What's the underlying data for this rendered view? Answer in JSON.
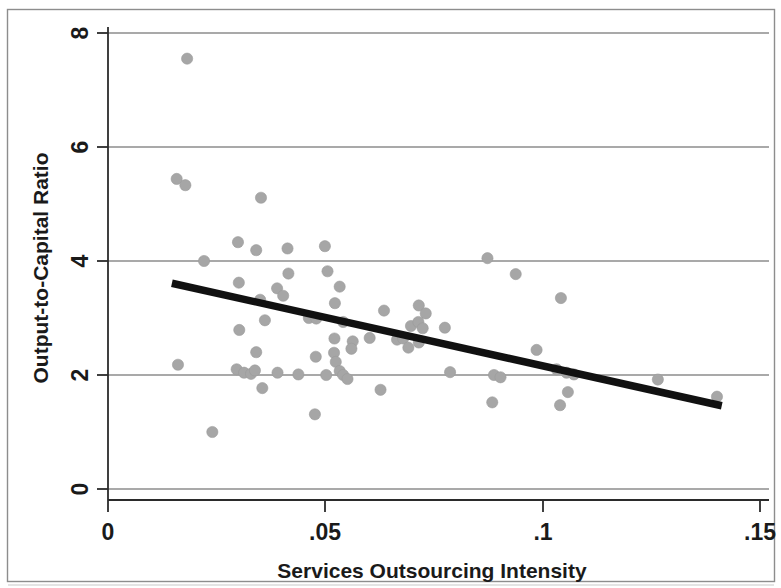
{
  "figure": {
    "background_color": "#ffffff",
    "frame_color": "#8d8d8d",
    "marker_color": "#a6a6a6",
    "fitline_color": "#111111",
    "grid_color": "#555555"
  },
  "chart_data": {
    "type": "scatter",
    "title": "",
    "xlabel": "Services Outsourcing Intensity",
    "ylabel": "Output-to-Capital Ratio",
    "xlim": [
      0,
      0.15
    ],
    "ylim": [
      0,
      8
    ],
    "xticks": [
      0,
      0.05,
      0.1,
      0.15
    ],
    "xticklabels": [
      "0",
      ".05",
      ".1",
      ".15"
    ],
    "yticks": [
      0,
      2,
      4,
      6,
      8
    ],
    "yticklabels": [
      "0",
      "2",
      "4",
      "6",
      "8"
    ],
    "grid": "horizontal",
    "legend": "none",
    "points": [
      {
        "x": 0.0182,
        "y": 7.55
      },
      {
        "x": 0.0158,
        "y": 5.44
      },
      {
        "x": 0.0178,
        "y": 5.33
      },
      {
        "x": 0.0352,
        "y": 5.11
      },
      {
        "x": 0.0299,
        "y": 4.33
      },
      {
        "x": 0.0341,
        "y": 4.19
      },
      {
        "x": 0.0413,
        "y": 4.22
      },
      {
        "x": 0.0221,
        "y": 4.0
      },
      {
        "x": 0.0499,
        "y": 4.26
      },
      {
        "x": 0.0873,
        "y": 4.05
      },
      {
        "x": 0.0301,
        "y": 3.62
      },
      {
        "x": 0.0389,
        "y": 3.52
      },
      {
        "x": 0.0415,
        "y": 3.78
      },
      {
        "x": 0.0505,
        "y": 3.82
      },
      {
        "x": 0.0533,
        "y": 3.55
      },
      {
        "x": 0.0938,
        "y": 3.77
      },
      {
        "x": 0.1042,
        "y": 3.35
      },
      {
        "x": 0.035,
        "y": 3.32
      },
      {
        "x": 0.0403,
        "y": 3.39
      },
      {
        "x": 0.0522,
        "y": 3.26
      },
      {
        "x": 0.0635,
        "y": 3.13
      },
      {
        "x": 0.0715,
        "y": 3.22
      },
      {
        "x": 0.0731,
        "y": 3.08
      },
      {
        "x": 0.0302,
        "y": 2.79
      },
      {
        "x": 0.0361,
        "y": 2.96
      },
      {
        "x": 0.0462,
        "y": 3.0
      },
      {
        "x": 0.0479,
        "y": 2.99
      },
      {
        "x": 0.0541,
        "y": 2.93
      },
      {
        "x": 0.0697,
        "y": 2.86
      },
      {
        "x": 0.0714,
        "y": 2.93
      },
      {
        "x": 0.0724,
        "y": 2.82
      },
      {
        "x": 0.0775,
        "y": 2.83
      },
      {
        "x": 0.0521,
        "y": 2.64
      },
      {
        "x": 0.0563,
        "y": 2.59
      },
      {
        "x": 0.0602,
        "y": 2.65
      },
      {
        "x": 0.0665,
        "y": 2.62
      },
      {
        "x": 0.0679,
        "y": 2.64
      },
      {
        "x": 0.0691,
        "y": 2.48
      },
      {
        "x": 0.0715,
        "y": 2.57
      },
      {
        "x": 0.0341,
        "y": 2.4
      },
      {
        "x": 0.0478,
        "y": 2.32
      },
      {
        "x": 0.052,
        "y": 2.39
      },
      {
        "x": 0.0524,
        "y": 2.23
      },
      {
        "x": 0.056,
        "y": 2.46
      },
      {
        "x": 0.0986,
        "y": 2.44
      },
      {
        "x": 0.1032,
        "y": 2.1
      },
      {
        "x": 0.0296,
        "y": 2.1
      },
      {
        "x": 0.0313,
        "y": 2.04
      },
      {
        "x": 0.0329,
        "y": 2.02
      },
      {
        "x": 0.0338,
        "y": 2.08
      },
      {
        "x": 0.039,
        "y": 2.04
      },
      {
        "x": 0.0438,
        "y": 2.01
      },
      {
        "x": 0.0502,
        "y": 2.0
      },
      {
        "x": 0.0533,
        "y": 2.07
      },
      {
        "x": 0.0541,
        "y": 2.0
      },
      {
        "x": 0.0551,
        "y": 1.93
      },
      {
        "x": 0.0787,
        "y": 2.05
      },
      {
        "x": 0.0888,
        "y": 2.0
      },
      {
        "x": 0.0903,
        "y": 1.96
      },
      {
        "x": 0.1055,
        "y": 2.04
      },
      {
        "x": 0.1072,
        "y": 2.01
      },
      {
        "x": 0.1265,
        "y": 1.92
      },
      {
        "x": 0.0161,
        "y": 2.18
      },
      {
        "x": 0.0355,
        "y": 1.77
      },
      {
        "x": 0.0627,
        "y": 1.74
      },
      {
        "x": 0.0884,
        "y": 1.52
      },
      {
        "x": 0.104,
        "y": 1.47
      },
      {
        "x": 0.1058,
        "y": 1.7
      },
      {
        "x": 0.0476,
        "y": 1.31
      },
      {
        "x": 0.024,
        "y": 1.0
      },
      {
        "x": 0.1401,
        "y": 1.62
      }
    ],
    "fit_line": {
      "label": "linear fit",
      "x_start": 0.0147,
      "y_start": 3.61,
      "x_end": 0.1412,
      "y_end": 1.46
    }
  }
}
